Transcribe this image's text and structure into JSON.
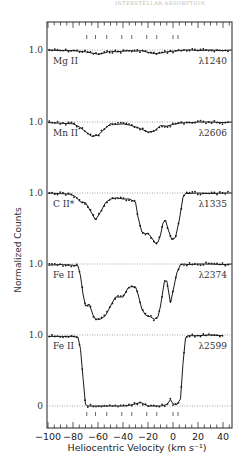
{
  "header": {
    "text": "INTERSTELLAR ABSORPTION"
  },
  "chart_data": {
    "type": "line",
    "title": "",
    "xlabel": "Heliocentric Velocity (km s⁻¹)",
    "ylabel": "Normalized Counts",
    "xlim": [
      -100,
      47
    ],
    "xticks": [
      -100,
      -80,
      -60,
      -40,
      -20,
      0,
      20,
      40
    ],
    "xtick_labels": [
      "−100",
      "−80",
      "−60",
      "−40",
      "−20",
      "0",
      "20",
      "40"
    ],
    "grid": false,
    "legend": null,
    "component_velocities": [
      -69,
      -62,
      -53,
      -41,
      -33,
      -21,
      -13,
      0,
      4
    ],
    "zero_level_label": "0",
    "panels": [
      {
        "ion": "Mg II",
        "wavelength": "λ1240",
        "continuum_label": "1.0",
        "offset_y": 50,
        "scale": 60,
        "x": [
          -100,
          -90,
          -80,
          -75,
          -70,
          -65,
          -60,
          -55,
          -50,
          -45,
          -40,
          -35,
          -30,
          -25,
          -20,
          -15,
          -10,
          -5,
          0,
          5,
          10,
          15,
          20,
          30,
          40,
          47
        ],
        "y": [
          1.0,
          0.99,
          0.99,
          0.98,
          0.97,
          0.95,
          0.93,
          0.95,
          0.98,
          0.97,
          0.98,
          0.99,
          0.98,
          0.99,
          0.96,
          0.94,
          0.95,
          0.97,
          0.98,
          0.99,
          1.0,
          1.0,
          0.99,
          1.0,
          0.99,
          1.0
        ]
      },
      {
        "ion": "Mn II",
        "wavelength": "λ2606",
        "continuum_label": "1.0",
        "offset_y": 122,
        "scale": 60,
        "x": [
          -100,
          -90,
          -80,
          -75,
          -70,
          -65,
          -60,
          -55,
          -50,
          -45,
          -40,
          -35,
          -30,
          -25,
          -20,
          -15,
          -10,
          -5,
          0,
          5,
          10,
          15,
          20,
          30,
          40,
          47
        ],
        "y": [
          0.99,
          0.98,
          0.97,
          0.92,
          0.84,
          0.76,
          0.78,
          0.88,
          0.97,
          0.96,
          0.97,
          0.95,
          0.92,
          0.88,
          0.83,
          0.85,
          0.94,
          0.93,
          0.96,
          0.98,
          0.99,
          0.99,
          1.0,
          1.0,
          0.99,
          1.0
        ]
      },
      {
        "ion": "C II*",
        "wavelength": "λ1335",
        "continuum_label": "1.0",
        "offset_y": 193,
        "scale": 60,
        "x": [
          -100,
          -90,
          -82,
          -78,
          -74,
          -70,
          -66,
          -62,
          -58,
          -54,
          -50,
          -45,
          -40,
          -35,
          -30,
          -28,
          -25,
          -22,
          -20,
          -17,
          -14,
          -12,
          -10,
          -8,
          -6,
          -4,
          -1,
          2,
          5,
          8,
          10,
          20,
          30,
          40,
          47
        ],
        "y": [
          1.0,
          0.99,
          0.98,
          0.94,
          0.85,
          0.84,
          0.7,
          0.55,
          0.68,
          0.84,
          0.9,
          0.92,
          0.9,
          0.9,
          0.85,
          0.6,
          0.35,
          0.32,
          0.33,
          0.25,
          0.16,
          0.18,
          0.3,
          0.5,
          0.55,
          0.4,
          0.22,
          0.26,
          0.55,
          0.93,
          0.99,
          1.0,
          0.99,
          1.0,
          1.0
        ]
      },
      {
        "ion": "Fe II",
        "wavelength": "λ2374",
        "continuum_label": "1.0",
        "offset_y": 264,
        "scale": 60,
        "x": [
          -100,
          -90,
          -80,
          -76,
          -74,
          -72,
          -70,
          -67,
          -64,
          -62,
          -58,
          -54,
          -50,
          -46,
          -42,
          -40,
          -36,
          -34,
          -30,
          -28,
          -25,
          -22,
          -18,
          -15,
          -12,
          -10,
          -7,
          -5,
          -2,
          0,
          3,
          6,
          9,
          12,
          20,
          30,
          40,
          47
        ],
        "y": [
          0.98,
          0.99,
          0.98,
          0.97,
          0.8,
          0.5,
          0.3,
          0.33,
          0.15,
          0.08,
          0.08,
          0.14,
          0.3,
          0.45,
          0.45,
          0.45,
          0.6,
          0.62,
          0.62,
          0.5,
          0.25,
          0.15,
          0.12,
          0.08,
          0.12,
          0.3,
          0.7,
          0.72,
          0.35,
          0.55,
          0.85,
          0.99,
          1.0,
          0.99,
          1.0,
          1.0,
          0.99,
          1.0
        ]
      },
      {
        "ion": "Fe II",
        "wavelength": "λ2599",
        "continuum_label": "1.0",
        "offset_y": 335,
        "scale": 71,
        "x": [
          -100,
          -90,
          -80,
          -76,
          -74,
          -72,
          -70,
          -68,
          -60,
          -50,
          -40,
          -35,
          -30,
          -26,
          -20,
          -10,
          -5,
          -2,
          0,
          3,
          6,
          8,
          10,
          12,
          20,
          30,
          40
        ],
        "y": [
          0.98,
          0.98,
          0.98,
          0.97,
          0.8,
          0.4,
          0.02,
          0.0,
          0.0,
          0.0,
          0.0,
          0.01,
          0.03,
          0.05,
          0.0,
          0.0,
          0.02,
          0.09,
          0.03,
          0.02,
          0.1,
          0.6,
          0.96,
          0.99,
          0.99,
          1.0,
          0.99
        ]
      }
    ]
  }
}
